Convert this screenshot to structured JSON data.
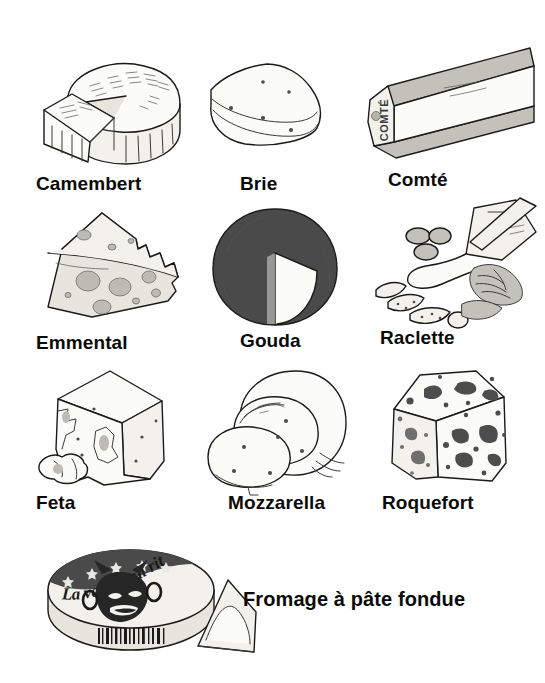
{
  "page": {
    "background_color": "#ffffff",
    "ink_color": "#1a1a1a",
    "label_color": "#0a0a0a"
  },
  "grid": {
    "columns": 3,
    "rows": 4
  },
  "items": [
    {
      "id": "camembert",
      "label": "Camembert",
      "icon": "camembert-wheel-with-wedge-icon",
      "description": "Round soft-rind wheel with a wedge cut out and set in front",
      "row": 1,
      "column": 1
    },
    {
      "id": "brie",
      "label": "Brie",
      "icon": "brie-wedge-icon",
      "description": "Triangular wedge of soft cheese with small holes",
      "row": 1,
      "column": 2
    },
    {
      "id": "comte",
      "label": "Comté",
      "icon": "comte-bar-icon",
      "description": "Long rectangular bar of hard cheese with dark rind",
      "rind_text": "COMTÉ",
      "row": 1,
      "column": 3
    },
    {
      "id": "emmental",
      "label": "Emmental",
      "icon": "emmental-wedge-holes-icon",
      "description": "Wedge of hard cheese with large round holes",
      "row": 2,
      "column": 1
    },
    {
      "id": "gouda",
      "label": "Gouda",
      "icon": "gouda-wheel-icon",
      "description": "Dark-rind round wheel with a V wedge removed",
      "row": 2,
      "column": 2
    },
    {
      "id": "raclette",
      "label": "Raclette",
      "icon": "raclette-scraper-icon",
      "description": "Melted cheese scraped over potatoes, pickles and charcuterie",
      "row": 2,
      "column": 3
    },
    {
      "id": "feta",
      "label": "Feta",
      "icon": "feta-block-icon",
      "description": "Crumbly white block with loose crumbles beside it",
      "row": 3,
      "column": 1
    },
    {
      "id": "mozzarella",
      "label": "Mozzarella",
      "icon": "mozzarella-ball-slices-icon",
      "description": "Soft white ball with two slices cut from it",
      "row": 3,
      "column": 2
    },
    {
      "id": "roquefort",
      "label": "Roquefort",
      "icon": "roquefort-block-icon",
      "description": "Blue-veined block of cheese",
      "row": 3,
      "column": 3
    },
    {
      "id": "fromage-a-pate-fondue",
      "label": "Fromage à pâte fondue",
      "icon": "processed-cheese-box-icon",
      "description": "Round processed cheese box with laughing cow label, stars, barcode and a foil-wrapped triangle portion",
      "brand_text": "La vache qui rit",
      "row": 4,
      "column": 1
    }
  ]
}
